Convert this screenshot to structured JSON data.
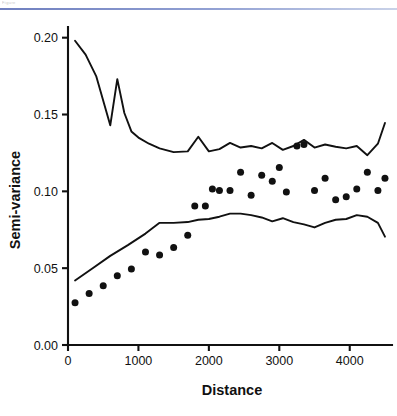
{
  "header": {
    "caption": "Figure",
    "rule_color": "#7d8cc4"
  },
  "chart_data": {
    "type": "scatter",
    "title": "",
    "subtitle": "",
    "xlabel": "Distance",
    "ylabel": "Semi-variance",
    "xlim": [
      0,
      4600
    ],
    "ylim": [
      0.0,
      0.205
    ],
    "xticks": [
      0,
      1000,
      2000,
      3000,
      4000
    ],
    "xtick_labels": [
      "0",
      "1000",
      "2000",
      "3000",
      "4000"
    ],
    "yticks": [
      0.0,
      0.05,
      0.1,
      0.15,
      0.2
    ],
    "ytick_labels": [
      "0.00",
      "0.05",
      "0.10",
      "0.15",
      "0.20"
    ],
    "grid": false,
    "legend": "none",
    "marker_color": "#111111",
    "line_color": "#111111",
    "series": [
      {
        "name": "upper-line",
        "type": "line",
        "x": [
          100,
          250,
          400,
          600,
          700,
          800,
          900,
          1000,
          1150,
          1300,
          1500,
          1700,
          1850,
          2000,
          2150,
          2300,
          2450,
          2600,
          2750,
          2900,
          3050,
          3200,
          3350,
          3500,
          3650,
          3800,
          3950,
          4100,
          4250,
          4400,
          4500
        ],
        "y": [
          0.198,
          0.189,
          0.175,
          0.143,
          0.173,
          0.151,
          0.139,
          0.135,
          0.131,
          0.128,
          0.1255,
          0.126,
          0.1355,
          0.126,
          0.1275,
          0.1315,
          0.1285,
          0.1295,
          0.128,
          0.1315,
          0.127,
          0.1295,
          0.1335,
          0.1285,
          0.1305,
          0.129,
          0.128,
          0.1295,
          0.1235,
          0.131,
          0.1445
        ]
      },
      {
        "name": "lower-line",
        "type": "line",
        "x": [
          100,
          350,
          600,
          850,
          1100,
          1300,
          1500,
          1700,
          1850,
          2000,
          2150,
          2300,
          2450,
          2600,
          2750,
          2900,
          3050,
          3200,
          3350,
          3500,
          3650,
          3800,
          3950,
          4100,
          4250,
          4400,
          4500
        ],
        "y": [
          0.042,
          0.05,
          0.058,
          0.065,
          0.0725,
          0.0795,
          0.0795,
          0.08,
          0.0815,
          0.082,
          0.0835,
          0.0855,
          0.0855,
          0.0845,
          0.083,
          0.0805,
          0.0825,
          0.08,
          0.0785,
          0.0765,
          0.0795,
          0.0815,
          0.082,
          0.0845,
          0.0835,
          0.0795,
          0.0705
        ]
      },
      {
        "name": "points",
        "type": "scatter",
        "x": [
          100,
          300,
          500,
          700,
          900,
          1100,
          1300,
          1500,
          1700,
          1800,
          1950,
          2050,
          2150,
          2300,
          2450,
          2600,
          2750,
          2900,
          3000,
          3100,
          3250,
          3350,
          3500,
          3650,
          3800,
          3950,
          4100,
          4250,
          4400,
          4500
        ],
        "y": [
          0.0275,
          0.0335,
          0.0385,
          0.045,
          0.0495,
          0.0605,
          0.0585,
          0.0635,
          0.0715,
          0.0905,
          0.0905,
          0.1015,
          0.1005,
          0.1005,
          0.1125,
          0.0975,
          0.1105,
          0.1065,
          0.1155,
          0.0995,
          0.1295,
          0.1305,
          0.1005,
          0.1085,
          0.0945,
          0.0965,
          0.1015,
          0.1125,
          0.1005,
          0.1085
        ]
      }
    ]
  }
}
